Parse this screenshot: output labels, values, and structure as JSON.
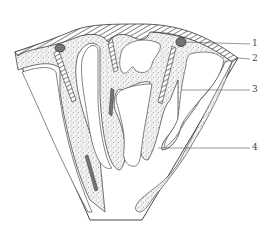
{
  "diagram": {
    "type": "cross-section schematic (fan-shaped)",
    "callouts": [
      {
        "id": "1",
        "label": "1",
        "y": 44
      },
      {
        "id": "2",
        "label": "2",
        "y": 59
      },
      {
        "id": "3",
        "label": "3",
        "y": 90
      },
      {
        "id": "4",
        "label": "4",
        "y": 148
      }
    ],
    "colors": {
      "line": "#333333",
      "stipple": "#555555",
      "background": "#ffffff"
    }
  }
}
